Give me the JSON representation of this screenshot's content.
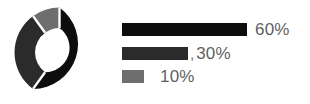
{
  "chart_data": {
    "type": "pie",
    "title": "",
    "subtitle": "",
    "xlabel": "",
    "ylabel": "",
    "grid": false,
    "legend_position": "right",
    "donut": true,
    "inner_radius_ratio": 0.47,
    "start_angle_deg": 0,
    "direction": "clockwise",
    "separator_color": "#ffffff",
    "categories": [
      "60%",
      "30%",
      "10%"
    ],
    "values": [
      60,
      30,
      10
    ],
    "colors": [
      "#0d0d0d",
      "#2b2b2b",
      "#6e6e6e"
    ],
    "slices": [
      {
        "label": "60%",
        "value": 60,
        "color": "#0d0d0d"
      },
      {
        "label": "30%",
        "value": 30,
        "color": "#2b2b2b"
      },
      {
        "label": "10%",
        "value": 10,
        "color": "#6e6e6e"
      }
    ],
    "legend_entries": [
      {
        "label": "60%",
        "value": 60,
        "color": "#0d0d0d",
        "bar_width_px": 125,
        "separator": ""
      },
      {
        "label": "30%",
        "value": 30,
        "color": "#2b2b2b",
        "bar_width_px": 66,
        "separator": ","
      },
      {
        "label": "10%",
        "value": 10,
        "color": "#6e6e6e",
        "bar_width_px": 22,
        "separator": ""
      }
    ]
  },
  "colors": {
    "background": "#ffffff",
    "text": "#5f5f5f",
    "slice_1": "#0d0d0d",
    "slice_2": "#2b2b2b",
    "slice_3": "#6e6e6e"
  }
}
